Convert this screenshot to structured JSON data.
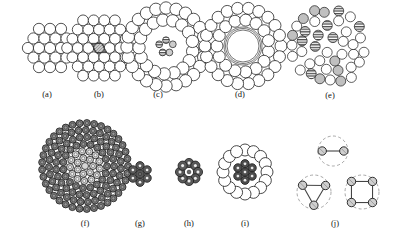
{
  "figure": {
    "background_color": "#ffffff",
    "width": 398,
    "height": 241,
    "stroke_color": "#1a1a1a",
    "fill_white": "#ffffff",
    "fill_light_gray": "#d8d8d8",
    "fill_mid_gray": "#b8b8b8",
    "fill_dark_gray": "#6e6e6e",
    "fill_very_dark": "#4a4a4a",
    "hatch_color": "#555555",
    "dashed_color": "#888888"
  },
  "panels": [
    {
      "id": "a",
      "label": "(a)",
      "label_x": 47,
      "label_y": 96,
      "kind": "hex-packing",
      "description": "Hexagonal close packing of uniform white circles",
      "center_x": 50,
      "center_y": 48,
      "circle_radius": 5.6,
      "rings": 2,
      "circle_count": 19,
      "fill": "#ffffff"
    },
    {
      "id": "b",
      "label": "(b)",
      "label_x": 99,
      "label_y": 96,
      "kind": "hex-packing-with-rhombus",
      "description": "Hexagonal packing with shaded rhombic unit cell highlighted at center",
      "center_x": 99,
      "center_y": 48,
      "circle_radius": 5.4,
      "rings": 3,
      "circle_count": 37,
      "fill": "#ffffff",
      "overlay_fill": "#c9c9c9"
    },
    {
      "id": "c",
      "label": "(c)",
      "label_x": 158,
      "label_y": 96,
      "kind": "annular-packing",
      "description": "Annular ring packing with small striped core cluster",
      "center_x": 166,
      "center_y": 47,
      "circle_radius": 6.2,
      "core_circle_radius": 3.4,
      "outer_ring_counts": [
        24,
        17
      ],
      "core_count": 5,
      "fill": "#ffffff",
      "core_fill": "#cccccc"
    },
    {
      "id": "d",
      "label": "(d)",
      "label_x": 240,
      "label_y": 96,
      "kind": "hollow-annulus",
      "description": "Two rings of circles surrounding an empty core bounded by concentric thin circles",
      "center_x": 243,
      "center_y": 46,
      "circle_radius": 6.0,
      "outer_ring_counts": [
        22,
        15
      ],
      "core_circle_radii": [
        16,
        17.5,
        19
      ],
      "fill": "#ffffff"
    },
    {
      "id": "e",
      "label": "(e)",
      "label_x": 330,
      "label_y": 97,
      "kind": "random-dense-packing",
      "description": "Dense disordered packing of mixed white, gray and horizontally striped circles",
      "center_x": 330,
      "center_y": 46,
      "circle_radius": 5.0,
      "boundary_radius": 44,
      "circle_count": 112,
      "fills": [
        "#ffffff",
        "#c0c0c0",
        "striped"
      ]
    },
    {
      "id": "f",
      "label": "(f)",
      "label_x": 85,
      "label_y": 225,
      "kind": "concentric-ring-packing",
      "description": "Many concentric rings of small dark ringed circles with lighter inner core",
      "center_x": 85,
      "center_y": 166,
      "circle_radius": 3.5,
      "ring_radii": [
        8,
        15,
        22,
        29,
        36,
        43
      ],
      "ring_counts": [
        7,
        13,
        19,
        25,
        31,
        37
      ],
      "fill_outer": "#7a7a7a",
      "fill_inner": "#d5d5d5"
    },
    {
      "id": "g",
      "label": "(g)",
      "label_x": 140,
      "label_y": 225,
      "kind": "flower-cluster",
      "description": "Small seven-circle flower cluster of dark ringed circles",
      "center_x": 140,
      "center_y": 174,
      "circle_radius": 4.2,
      "petal_count": 6,
      "circle_count": 7,
      "fill": "#5a5a5a"
    },
    {
      "id": "h",
      "label": "(h)",
      "label_x": 189,
      "label_y": 225,
      "kind": "flower-cluster",
      "description": "Flower cluster with eight outer ringed circles around a white center",
      "center_x": 189,
      "center_y": 172,
      "circle_radius": 4.6,
      "petal_count": 8,
      "circle_count": 9,
      "fill": "#5a5a5a",
      "center_fill": "#ffffff"
    },
    {
      "id": "i",
      "label": "(i)",
      "label_x": 245,
      "label_y": 225,
      "kind": "ring-enclosing-cluster",
      "description": "Ring of large white circles enclosing a cluster of dark concentric circles",
      "center_x": 245,
      "center_y": 172,
      "outer_circle_radius": 6.0,
      "outer_count": 16,
      "outer_ring_radius": 22,
      "inner_circle_radius": 4.2,
      "inner_count": 7,
      "fill_outer": "#ffffff",
      "fill_inner": "#4e4e4e"
    },
    {
      "id": "j",
      "label": "(j)",
      "label_x": 335,
      "label_y": 225,
      "kind": "graph-diagrams",
      "description": "Three node-link graphs each inscribed in a dashed circle",
      "node_radius": 4.2,
      "node_fill": "#cfcfcf",
      "edge_color": "#444444",
      "dashed_color": "#909090",
      "graphs": [
        {
          "name": "dimer",
          "node_count": 2,
          "edge_count": 1,
          "center_x": 333,
          "center_y": 151,
          "enclosing_radius": 15
        },
        {
          "name": "triangle",
          "node_count": 3,
          "edge_count": 3,
          "center_x": 314,
          "center_y": 192,
          "enclosing_radius": 17
        },
        {
          "name": "square",
          "node_count": 4,
          "edge_count": 4,
          "center_x": 362,
          "center_y": 192,
          "enclosing_radius": 17
        }
      ]
    }
  ]
}
